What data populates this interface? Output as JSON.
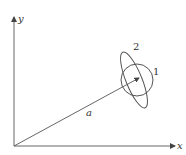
{
  "diagram": {
    "axes": {
      "x_label": "x",
      "y_label": "y"
    },
    "vector": {
      "label": "a"
    },
    "shapes": [
      {
        "id": "circle",
        "label": "1"
      },
      {
        "id": "ellipse",
        "label": "2"
      }
    ],
    "colors": {
      "stroke": "#555555",
      "text": "#333333",
      "background": "#ffffff"
    }
  }
}
